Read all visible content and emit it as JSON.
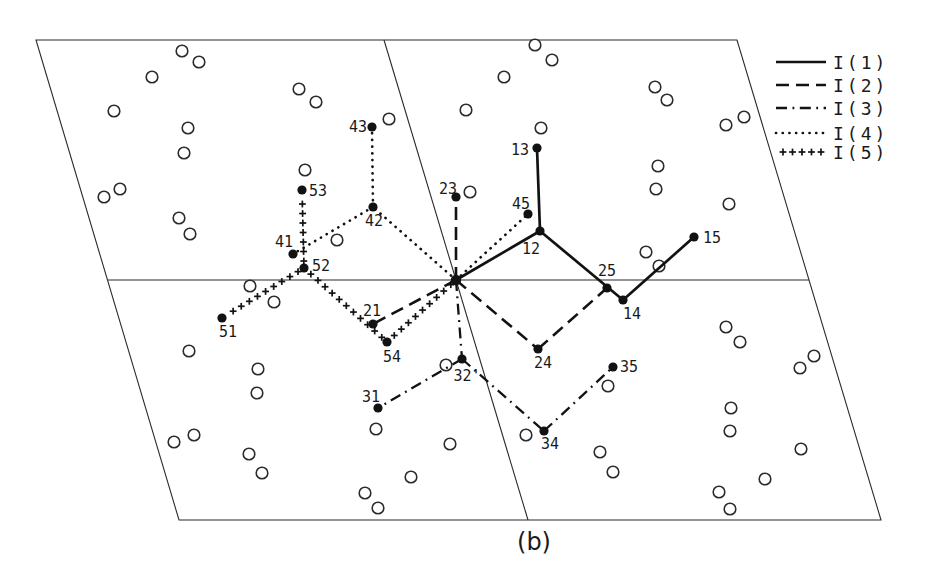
{
  "figure": {
    "caption": "(b)",
    "canvas": {
      "width": 934,
      "height": 579
    },
    "colors": {
      "background": "#ffffff",
      "ink": "#121212",
      "thin_line": "#2b2b2b"
    },
    "cell": {
      "outer_parallelogram": [
        [
          36,
          40
        ],
        [
          737,
          40
        ],
        [
          881,
          520
        ],
        [
          179,
          520
        ]
      ],
      "inner_lines": [
        {
          "name": "horizontal-midline",
          "from": [
            108,
            280
          ],
          "to": [
            809,
            280
          ]
        },
        {
          "name": "slanted-midline",
          "from": [
            384,
            40
          ],
          "to": [
            528,
            520
          ]
        }
      ]
    },
    "origin": {
      "id": "origin",
      "x": 456,
      "y": 280
    },
    "atoms": [
      {
        "id": "origin",
        "x": 456,
        "y": 280,
        "label": "",
        "lx": 0,
        "ly": 0
      },
      {
        "id": "12",
        "x": 540,
        "y": 231,
        "label": "12",
        "lx": 531,
        "ly": 254
      },
      {
        "id": "13",
        "x": 537,
        "y": 148,
        "label": "13",
        "lx": 520,
        "ly": 155
      },
      {
        "id": "14",
        "x": 623,
        "y": 300,
        "label": "14",
        "lx": 632,
        "ly": 319
      },
      {
        "id": "15",
        "x": 694,
        "y": 237,
        "label": "15",
        "lx": 712,
        "ly": 243
      },
      {
        "id": "21",
        "x": 373,
        "y": 324,
        "label": "21",
        "lx": 372,
        "ly": 316
      },
      {
        "id": "23",
        "x": 456,
        "y": 197,
        "label": "23",
        "lx": 448,
        "ly": 194
      },
      {
        "id": "24",
        "x": 538,
        "y": 349,
        "label": "24",
        "lx": 543,
        "ly": 368
      },
      {
        "id": "25",
        "x": 607,
        "y": 288,
        "label": "25",
        "lx": 607,
        "ly": 276
      },
      {
        "id": "31",
        "x": 378,
        "y": 408,
        "label": "31",
        "lx": 371,
        "ly": 402
      },
      {
        "id": "32p",
        "x": 462,
        "y": 359,
        "label": "32'",
        "lx": 467,
        "ly": 381
      },
      {
        "id": "34",
        "x": 544,
        "y": 431,
        "label": "34",
        "lx": 550,
        "ly": 449
      },
      {
        "id": "35",
        "x": 613,
        "y": 367,
        "label": "35",
        "lx": 629,
        "ly": 372
      },
      {
        "id": "41",
        "x": 293,
        "y": 254,
        "label": "41",
        "lx": 284,
        "ly": 247
      },
      {
        "id": "42",
        "x": 373,
        "y": 207,
        "label": "42",
        "lx": 374,
        "ly": 226
      },
      {
        "id": "43",
        "x": 372,
        "y": 127,
        "label": "43",
        "lx": 358,
        "ly": 132
      },
      {
        "id": "45",
        "x": 528,
        "y": 214,
        "label": "45",
        "lx": 521,
        "ly": 209
      },
      {
        "id": "51",
        "x": 222,
        "y": 318,
        "label": "51",
        "lx": 228,
        "ly": 337
      },
      {
        "id": "52",
        "x": 304,
        "y": 268,
        "label": "52",
        "lx": 321,
        "ly": 271
      },
      {
        "id": "53",
        "x": 302,
        "y": 190,
        "label": "53",
        "lx": 318,
        "ly": 196
      },
      {
        "id": "54",
        "x": 387,
        "y": 342,
        "label": "54",
        "lx": 392,
        "ly": 362
      }
    ],
    "chains": [
      {
        "name": "I(1)",
        "style": "solid",
        "segments": [
          [
            "origin",
            "12"
          ],
          [
            "12",
            "13"
          ],
          [
            "12",
            "14"
          ],
          [
            "14",
            "15"
          ]
        ]
      },
      {
        "name": "I(2)",
        "style": "dashed",
        "segments": [
          [
            "origin",
            "23"
          ],
          [
            "origin",
            "21"
          ],
          [
            "origin",
            "24"
          ],
          [
            "24",
            "25"
          ]
        ]
      },
      {
        "name": "I(3)",
        "style": "dashdot",
        "segments": [
          [
            "origin",
            "32p"
          ],
          [
            "32p",
            "31"
          ],
          [
            "32p",
            "34"
          ],
          [
            "34",
            "35"
          ]
        ]
      },
      {
        "name": "I(4)",
        "style": "dotted",
        "segments": [
          [
            "origin",
            "45"
          ],
          [
            "origin",
            "42"
          ],
          [
            "42",
            "41"
          ],
          [
            "42",
            "43"
          ]
        ]
      },
      {
        "name": "I(5)",
        "style": "plus",
        "segments": [
          [
            "origin",
            "54"
          ],
          [
            "54",
            "52"
          ],
          [
            "52",
            "53"
          ],
          [
            "52",
            "51"
          ]
        ]
      }
    ],
    "legend": {
      "line_x1": 776,
      "line_x2": 826,
      "text_x": 833,
      "entries": [
        {
          "label": "I(1)",
          "style": "solid",
          "y": 62
        },
        {
          "label": "I(2)",
          "style": "dashed",
          "y": 85
        },
        {
          "label": "I(3)",
          "style": "dashdot",
          "y": 108
        },
        {
          "label": "I(4)",
          "style": "dotted",
          "y": 133
        },
        {
          "label": "I(5)",
          "style": "plus",
          "y": 152
        }
      ]
    },
    "molecule_circles": [
      [
        182,
        51
      ],
      [
        199,
        62
      ],
      [
        152,
        77
      ],
      [
        114,
        111
      ],
      [
        188,
        128
      ],
      [
        184,
        153
      ],
      [
        120,
        189
      ],
      [
        104,
        197
      ],
      [
        179,
        218
      ],
      [
        190,
        234
      ],
      [
        299,
        89
      ],
      [
        316,
        102
      ],
      [
        305,
        170
      ],
      [
        337,
        240
      ],
      [
        389,
        119
      ],
      [
        466,
        110
      ],
      [
        504,
        77
      ],
      [
        535,
        45
      ],
      [
        552,
        60
      ],
      [
        541,
        128
      ],
      [
        470,
        192
      ],
      [
        655,
        87
      ],
      [
        667,
        100
      ],
      [
        726,
        125
      ],
      [
        744,
        117
      ],
      [
        658,
        166
      ],
      [
        656,
        189
      ],
      [
        729,
        204
      ],
      [
        646,
        252
      ],
      [
        659,
        266
      ],
      [
        250,
        286
      ],
      [
        274,
        302
      ],
      [
        189,
        351
      ],
      [
        258,
        369
      ],
      [
        257,
        393
      ],
      [
        194,
        435
      ],
      [
        174,
        442
      ],
      [
        249,
        454
      ],
      [
        262,
        473
      ],
      [
        376,
        429
      ],
      [
        365,
        493
      ],
      [
        378,
        508
      ],
      [
        411,
        477
      ],
      [
        450,
        444
      ],
      [
        446,
        365
      ],
      [
        526,
        435
      ],
      [
        600,
        452
      ],
      [
        613,
        472
      ],
      [
        608,
        386
      ],
      [
        726,
        327
      ],
      [
        740,
        342
      ],
      [
        814,
        356
      ],
      [
        800,
        368
      ],
      [
        731,
        408
      ],
      [
        730,
        431
      ],
      [
        801,
        449
      ],
      [
        765,
        479
      ],
      [
        719,
        492
      ],
      [
        730,
        509
      ]
    ]
  }
}
